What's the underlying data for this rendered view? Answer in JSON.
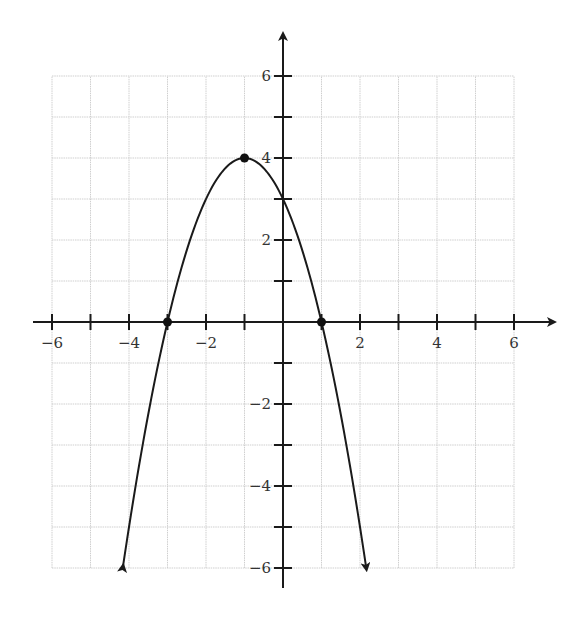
{
  "chart_data": {
    "type": "line",
    "title": "",
    "xlabel": "",
    "ylabel": "",
    "xlim": [
      -6,
      6
    ],
    "ylim": [
      -6,
      6
    ],
    "grid": true,
    "x_tick_labels": [
      "−6",
      "−4",
      "−2",
      "2",
      "4",
      "6"
    ],
    "x_tick_values": [
      -6,
      -4,
      -2,
      2,
      4,
      6
    ],
    "y_tick_labels": [
      "6",
      "4",
      "2",
      "−2",
      "−4",
      "−6"
    ],
    "y_tick_values": [
      6,
      4,
      2,
      -2,
      -4,
      -6
    ],
    "series": [
      {
        "name": "parabola",
        "equation": "y = -(x+1)^2 + 4",
        "a": -1,
        "h": -1,
        "k": 4,
        "x_range": [
          -4.16,
          2.16
        ],
        "arrows_both_ends": true,
        "color": "#1a1a1a"
      }
    ],
    "points": [
      {
        "label": "vertex",
        "x": -1,
        "y": 4
      },
      {
        "label": "x-intercept-left",
        "x": -3,
        "y": 0
      },
      {
        "label": "x-intercept-right",
        "x": 1,
        "y": 0
      }
    ]
  },
  "layout": {
    "origin_px": [
      283,
      322
    ],
    "unit_x_px": 38.5,
    "unit_y_px": 41
  }
}
